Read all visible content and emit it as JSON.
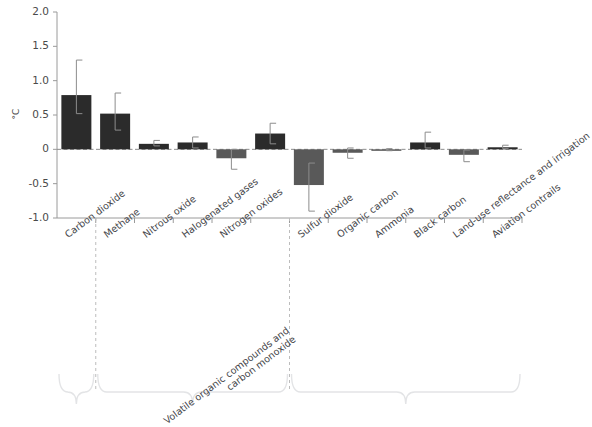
{
  "chart_data": {
    "type": "bar",
    "title": "",
    "subtitle": "",
    "xlabel": "",
    "ylabel": "°C",
    "ylim": [
      -1.0,
      2.0
    ],
    "yticks": [
      "2.0",
      "1.5",
      "1.0",
      "0.5",
      "0",
      "-0.5",
      "-1.0"
    ],
    "ytick_values": [
      2.0,
      1.5,
      1.0,
      0.5,
      0,
      -0.5,
      -1.0
    ],
    "grid": false,
    "legend": "none",
    "zero_line": true,
    "categories": [
      "Carbon dioxide",
      "Methane",
      "Nitrous oxide",
      "Halogenated gases",
      "Nitrogen oxides",
      "Volatile organic compounds and carbon monoxide",
      "Sulfur dioxide",
      "Organic carbon",
      "Ammonia",
      "Black carbon",
      "Land-use reflectance and irrigation",
      "Aviation contrails"
    ],
    "values": [
      0.79,
      0.52,
      0.08,
      0.1,
      -0.13,
      0.23,
      -0.52,
      -0.05,
      -0.01,
      0.1,
      -0.08,
      0.03
    ],
    "error_low": [
      0.52,
      0.28,
      0.05,
      0.02,
      -0.29,
      0.08,
      -0.9,
      -0.13,
      -0.02,
      0.02,
      -0.18,
      0.01
    ],
    "error_high": [
      1.3,
      0.82,
      0.13,
      0.18,
      0.0,
      0.38,
      -0.2,
      0.02,
      0.01,
      0.25,
      -0.01,
      0.06
    ],
    "series": [
      {
        "name": "Contribution to global warming",
        "values": [
          0.79,
          0.52,
          0.08,
          0.1,
          -0.13,
          0.23,
          -0.52,
          -0.05,
          -0.01,
          0.1,
          -0.08,
          0.03
        ]
      }
    ],
    "group_dividers": [
      1,
      6
    ],
    "brace_groups": 3,
    "colors": {
      "positive_bar": "#2b2b2b",
      "negative_bar": "#595959",
      "error_bar": "#8c8c8c",
      "axis": "#9a9a9a",
      "zero_line": "#8c8c8c",
      "divider": "#bcbcbc",
      "brace": "#e3e4e6",
      "text": "#45464a",
      "background": "#ffffff"
    }
  }
}
